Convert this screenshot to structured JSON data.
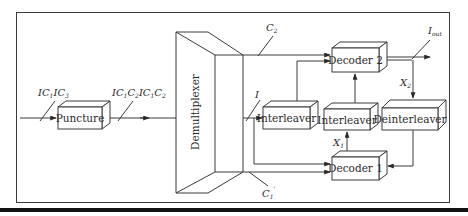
{
  "diagram": {
    "blocks": {
      "puncture": "Puncture",
      "demultiplexer": "Demultiplexer",
      "interleaver_a": "Interleaver",
      "interleaver_b": "Interleaver",
      "deinterleaver": "Deinterleaver",
      "decoder1": "Decoder 1",
      "decoder2": "Decoder 2"
    },
    "signals": {
      "input": {
        "parts": [
          {
            "t": "IC",
            "s": "1"
          },
          {
            "t": "IC",
            "s": "3"
          }
        ]
      },
      "punctured": {
        "parts": [
          {
            "t": "IC",
            "s": "1"
          },
          {
            "t": "C",
            "s": "2"
          },
          {
            "t": "IC",
            "s": "1"
          },
          {
            "t": "C",
            "s": "2"
          }
        ]
      },
      "c2": {
        "base": "C",
        "sub": "2"
      },
      "i": {
        "base": "I",
        "sub": ""
      },
      "c1_prime": {
        "base": "C",
        "sub": "1",
        "prime": "'"
      },
      "x1": {
        "base": "X",
        "sub": "1"
      },
      "x2": {
        "base": "X",
        "sub": "2"
      },
      "iout": {
        "base": "I",
        "sub": "out"
      }
    }
  }
}
